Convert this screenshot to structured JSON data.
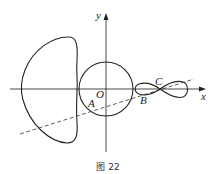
{
  "figure": {
    "caption": "图 22",
    "labels": {
      "x_axis": "x",
      "y_axis": "y",
      "origin": "O",
      "point_a": "A",
      "point_b": "B",
      "point_c": "C"
    },
    "elements": [
      {
        "type": "axis",
        "name": "x-axis"
      },
      {
        "type": "axis",
        "name": "y-axis"
      },
      {
        "type": "circle",
        "name": "unit-circle",
        "center": "O"
      },
      {
        "type": "closed-curve",
        "name": "left-d-shaped-curve"
      },
      {
        "type": "lemniscate",
        "name": "figure-eight-curve",
        "crossing_point": "C"
      },
      {
        "type": "dashed-line",
        "name": "secant-line",
        "passes_through": [
          "A",
          "B",
          "C"
        ]
      }
    ],
    "colors": {
      "stroke": "#222222",
      "background": "#ffffff"
    }
  }
}
